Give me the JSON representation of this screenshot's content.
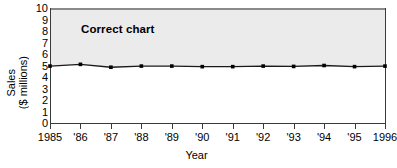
{
  "chart_data": {
    "type": "line",
    "title": "Correct chart",
    "xlabel": "Year",
    "ylabel": "Sales ($ millions)",
    "ylabel_lines": [
      "Sales",
      "($ millions)"
    ],
    "categories": [
      "1985",
      "'86",
      "'87",
      "'88",
      "'89",
      "'90",
      "'91",
      "'92",
      "'93",
      "'94",
      "'95",
      "1996"
    ],
    "x": [
      1985,
      1986,
      1987,
      1988,
      1989,
      1990,
      1991,
      1992,
      1993,
      1994,
      1995,
      1996
    ],
    "series": [
      {
        "name": "Sales",
        "values": [
          4.95,
          5.1,
          4.85,
          4.95,
          4.95,
          4.9,
          4.9,
          4.95,
          4.92,
          5.0,
          4.9,
          4.95
        ]
      }
    ],
    "ylim": [
      0,
      10
    ],
    "yticks": [
      "10",
      "9",
      "8",
      "7",
      "6",
      "5",
      "4",
      "3",
      "2",
      "1",
      "0"
    ],
    "ytick_values": [
      10,
      9,
      8,
      7,
      6,
      5,
      4,
      3,
      2,
      1,
      0
    ],
    "grid": false,
    "legend": "none",
    "marker": "filled-square",
    "line_color": "#1a1a1a",
    "marker_color": "#000000",
    "plot_shade_color": "#ebebeb",
    "axis_color": "#3a3a3a",
    "background_color": "#ffffff"
  }
}
